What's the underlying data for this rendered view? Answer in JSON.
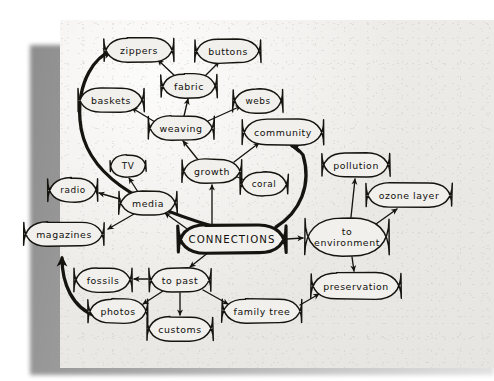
{
  "document": {
    "kind": "hand-drawn-concept-map",
    "title": "CONNECTIONS concept map",
    "paper_color": "#eceae6",
    "ink_color": "#15140f",
    "shadow_color": "#9a9a9a"
  },
  "chart_data": {
    "type": "diagram",
    "title": "CONNECTIONS",
    "nodes": [
      {
        "id": "zippers",
        "label": "zippers",
        "x": 139,
        "y": 50,
        "rx": 35,
        "ry": 12,
        "emphasis": "normal"
      },
      {
        "id": "buttons",
        "label": "buttons",
        "x": 228,
        "y": 51,
        "rx": 33,
        "ry": 12,
        "emphasis": "normal"
      },
      {
        "id": "fabric",
        "label": "fabric",
        "x": 189,
        "y": 86,
        "rx": 28,
        "ry": 12,
        "emphasis": "normal"
      },
      {
        "id": "baskets",
        "label": "baskets",
        "x": 111,
        "y": 100,
        "rx": 33,
        "ry": 12,
        "emphasis": "normal"
      },
      {
        "id": "webs",
        "label": "webs",
        "x": 258,
        "y": 101,
        "rx": 25,
        "ry": 12,
        "emphasis": "normal"
      },
      {
        "id": "weaving",
        "label": "weaving",
        "x": 181,
        "y": 128,
        "rx": 33,
        "ry": 12,
        "emphasis": "normal"
      },
      {
        "id": "community",
        "label": "community",
        "x": 283,
        "y": 132,
        "rx": 41,
        "ry": 13,
        "emphasis": "normal"
      },
      {
        "id": "growth",
        "label": "growth",
        "x": 212,
        "y": 171,
        "rx": 30,
        "ry": 12,
        "emphasis": "normal"
      },
      {
        "id": "coral",
        "label": "coral",
        "x": 264,
        "y": 184,
        "rx": 24,
        "ry": 12,
        "emphasis": "normal"
      },
      {
        "id": "pollution",
        "label": "pollution",
        "x": 356,
        "y": 165,
        "rx": 34,
        "ry": 12,
        "emphasis": "normal"
      },
      {
        "id": "ozone_layer",
        "label": "ozone layer",
        "x": 409,
        "y": 195,
        "rx": 43,
        "ry": 12,
        "emphasis": "normal"
      },
      {
        "id": "tv",
        "label": "TV",
        "x": 128,
        "y": 166,
        "rx": 18,
        "ry": 11,
        "emphasis": "normal"
      },
      {
        "id": "radio",
        "label": "radio",
        "x": 73,
        "y": 190,
        "rx": 25,
        "ry": 12,
        "emphasis": "normal"
      },
      {
        "id": "media",
        "label": "media",
        "x": 148,
        "y": 203,
        "rx": 29,
        "ry": 12,
        "emphasis": "normal"
      },
      {
        "id": "magazines",
        "label": "magazines",
        "x": 64,
        "y": 234,
        "rx": 40,
        "ry": 12,
        "emphasis": "normal"
      },
      {
        "id": "connections",
        "label": "CONNECTIONS",
        "x": 232,
        "y": 239,
        "rx": 54,
        "ry": 14,
        "emphasis": "hub"
      },
      {
        "id": "to_env",
        "label": "to environment",
        "x": 347,
        "y": 237,
        "rx": 42,
        "ry": 19,
        "emphasis": "normal",
        "lines": [
          "to",
          "environment"
        ]
      },
      {
        "id": "fossils",
        "label": "fossils",
        "x": 103,
        "y": 280,
        "rx": 29,
        "ry": 12,
        "emphasis": "normal"
      },
      {
        "id": "to_past",
        "label": "to past",
        "x": 180,
        "y": 280,
        "rx": 31,
        "ry": 12,
        "emphasis": "normal"
      },
      {
        "id": "preservation",
        "label": "preservation",
        "x": 356,
        "y": 286,
        "rx": 45,
        "ry": 13,
        "emphasis": "normal"
      },
      {
        "id": "photos",
        "label": "photos",
        "x": 118,
        "y": 311,
        "rx": 30,
        "ry": 12,
        "emphasis": "normal"
      },
      {
        "id": "family_tree",
        "label": "family tree",
        "x": 262,
        "y": 311,
        "rx": 40,
        "ry": 12,
        "emphasis": "normal"
      },
      {
        "id": "customs",
        "label": "customs",
        "x": 180,
        "y": 329,
        "rx": 33,
        "ry": 12,
        "emphasis": "normal"
      }
    ],
    "edges": [
      {
        "from": "fabric",
        "to": "zippers",
        "style": "thin",
        "path": "M 176 77 L 158 60"
      },
      {
        "from": "fabric",
        "to": "buttons",
        "style": "thin",
        "path": "M 204 77 L 219 62"
      },
      {
        "from": "weaving",
        "to": "fabric",
        "style": "thin",
        "path": "M 184 116 L 188 99"
      },
      {
        "from": "weaving",
        "to": "baskets",
        "style": "thin",
        "path": "M 155 122 L 132 108"
      },
      {
        "from": "weaving",
        "to": "webs",
        "style": "thin",
        "path": "M 208 121 L 241 106"
      },
      {
        "from": "growth",
        "to": "weaving",
        "style": "thin",
        "path": "M 199 161 L 183 141"
      },
      {
        "from": "growth",
        "to": "community",
        "style": "thin",
        "path": "M 234 162 L 259 143"
      },
      {
        "from": "growth",
        "to": "coral",
        "style": "thin",
        "path": "M 235 176 L 249 182"
      },
      {
        "from": "media",
        "to": "tv",
        "style": "thin",
        "path": "M 138 192 L 129 178"
      },
      {
        "from": "media",
        "to": "radio",
        "style": "thin",
        "path": "M 120 199 L 99 193"
      },
      {
        "from": "media",
        "to": "magazines",
        "style": "thin",
        "path": "M 134 214 L 108 229"
      },
      {
        "from": "connections",
        "to": "media",
        "style": "thin",
        "path": "M 190 231 L 165 213"
      },
      {
        "from": "connections",
        "to": "growth",
        "style": "thin",
        "path": "M 212 225 L 212 185"
      },
      {
        "from": "connections",
        "to": "to_env",
        "style": "thin",
        "path": "M 287 239 L 303 238"
      },
      {
        "from": "connections",
        "to": "to_past",
        "style": "thin",
        "path": "M 209 252 L 190 267"
      },
      {
        "from": "to_past",
        "to": "fossils",
        "style": "thin",
        "path": "M 148 279 L 134 279"
      },
      {
        "from": "to_past",
        "to": "photos",
        "style": "thin",
        "path": "M 163 291 L 143 304"
      },
      {
        "from": "to_past",
        "to": "customs",
        "style": "thin",
        "path": "M 180 293 L 180 315"
      },
      {
        "from": "to_past",
        "to": "family_tree",
        "style": "thin",
        "path": "M 203 290 L 228 304"
      },
      {
        "from": "to_env",
        "to": "pollution",
        "style": "thin",
        "path": "M 351 217 L 355 179"
      },
      {
        "from": "to_env",
        "to": "ozone_layer",
        "style": "thin",
        "path": "M 376 224 L 397 209"
      },
      {
        "from": "to_env",
        "to": "preservation",
        "style": "thin",
        "path": "M 352 257 L 354 271"
      },
      {
        "from": "family_tree",
        "to": "preservation",
        "style": "thin",
        "path": "M 300 305 L 319 294"
      },
      {
        "from": "connections",
        "to": "zippers",
        "style": "thick",
        "path": "M 212 226 C 140 205, 84 175, 80 120 C 77 80, 96 56, 112 51"
      },
      {
        "from": "connections",
        "to": "community",
        "style": "thick",
        "path": "M 276 227 C 300 212, 312 185, 303 155 C 299 150, 296 147, 292 146"
      },
      {
        "from": "photos",
        "to": "magazines",
        "style": "thick",
        "path": "M 96 316 C 72 308, 62 283, 62 258"
      }
    ]
  }
}
